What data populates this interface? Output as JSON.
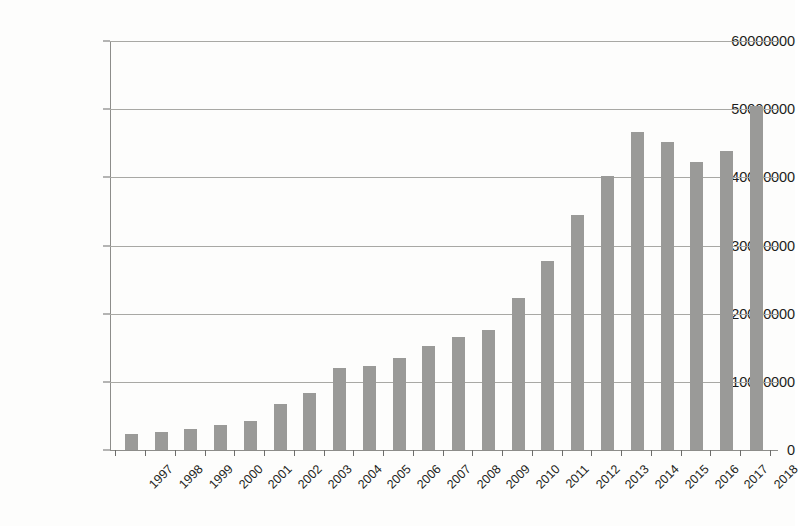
{
  "chart_data": {
    "type": "bar",
    "title": "",
    "subtitle": "",
    "xlabel": "",
    "ylabel": "",
    "categories": [
      "1997",
      "1998",
      "1999",
      "2000",
      "2001",
      "2002",
      "2003",
      "2004",
      "2005",
      "2006",
      "2007",
      "2008",
      "2009",
      "2010",
      "2011",
      "2012",
      "2013",
      "2014",
      "2015",
      "2016",
      "2017",
      "2018"
    ],
    "values": [
      2300000,
      2600000,
      3100000,
      3700000,
      4300000,
      6700000,
      8400000,
      12000000,
      12300000,
      13500000,
      15200000,
      16600000,
      17600000,
      22300000,
      27800000,
      34500000,
      40200000,
      46700000,
      45200000,
      42200000,
      43800000,
      50400000
    ],
    "ylim": [
      0,
      60000000
    ],
    "ytick_values": [
      0,
      10000000,
      20000000,
      30000000,
      40000000,
      50000000,
      60000000
    ],
    "ytick_labels": [
      "0",
      "10000000",
      "20000000",
      "30000000",
      "40000000",
      "50000000",
      "60000000"
    ],
    "grid": true,
    "legend": null,
    "legend_position": "none",
    "series_color": "#9a9a98",
    "gridline_color": "#a8a8a4",
    "axis_color": "#8d8d8a",
    "text_color": "#1d1d1b",
    "background_color": "#fdfdfc"
  }
}
